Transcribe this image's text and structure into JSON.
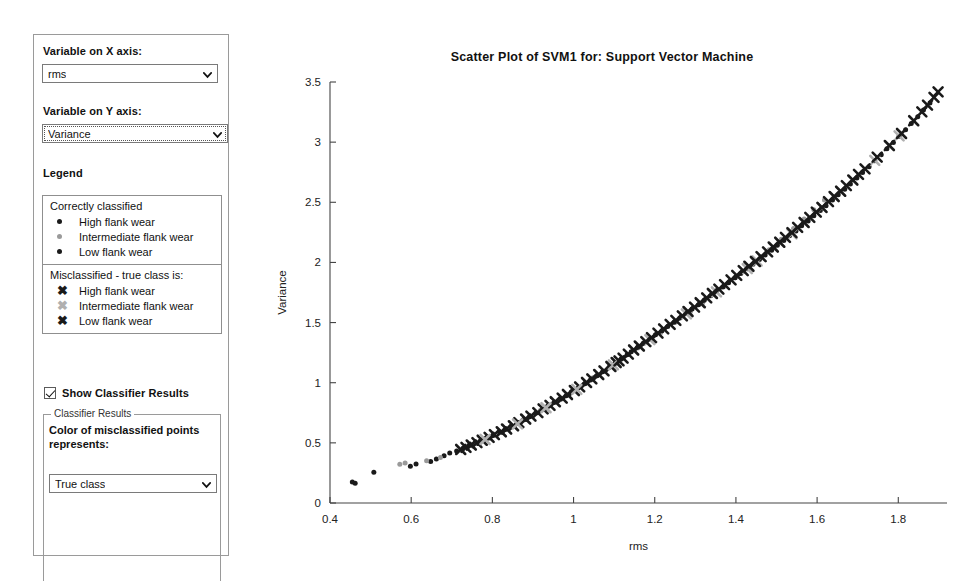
{
  "sidebar": {
    "x_axis_label": "Variable on X axis:",
    "x_axis_value": "rms",
    "y_axis_label": "Variable on Y axis:",
    "y_axis_value": "Variance",
    "legend_title": "Legend",
    "legend": {
      "correct_heading": "Correctly classified",
      "correct_items": [
        {
          "label": "High flank wear",
          "color": "#1a1a1a",
          "marker": "dot"
        },
        {
          "label": "Intermediate flank wear",
          "color": "#9a9a9a",
          "marker": "dot"
        },
        {
          "label": "Low flank wear",
          "color": "#1a1a1a",
          "marker": "dot"
        }
      ],
      "mis_heading": "Misclassified - true class is:",
      "mis_items": [
        {
          "label": "High flank wear",
          "color": "#1a1a1a",
          "marker": "x",
          "glyph": "✖"
        },
        {
          "label": "Intermediate flank wear",
          "color": "#b0b0b0",
          "marker": "x",
          "glyph": "✖"
        },
        {
          "label": "Low flank wear",
          "color": "#1a1a1a",
          "marker": "x",
          "glyph": "✖"
        }
      ]
    },
    "show_classifier_results_label": "Show Classifier Results",
    "show_classifier_results_checked": true,
    "classifier_fieldset_legend": "Classifier Results",
    "classifier_desc": "Color of misclassified points represents:",
    "classifier_value": "True class",
    "caret_icon": "chevron-down-icon"
  },
  "chart_data": {
    "type": "scatter",
    "title": "Scatter Plot of SVM1 for: Support Vector Machine",
    "xlabel": "rms",
    "ylabel": "Variance",
    "xlim": [
      0.4,
      1.92
    ],
    "ylim": [
      0,
      3.5
    ],
    "xticks": [
      0.4,
      0.6,
      0.8,
      1.0,
      1.2,
      1.4,
      1.6,
      1.8
    ],
    "xticklabels": [
      "0.4",
      "0.6",
      "0.8",
      "1",
      "1.2",
      "1.4",
      "1.6",
      "1.8"
    ],
    "yticks": [
      0,
      0.5,
      1.0,
      1.5,
      2.0,
      2.5,
      3.0,
      3.5
    ],
    "yticklabels": [
      "0",
      "0.5",
      "1",
      "1.5",
      "2",
      "2.5",
      "3",
      "3.5"
    ],
    "grid": false,
    "legend_position": "external-sidebar",
    "series": [
      {
        "name": "Correctly classified - High flank wear",
        "marker": "dot",
        "color": "#1a1a1a",
        "size": 5,
        "points": [
          [
            0.455,
            0.175
          ],
          [
            0.462,
            0.165
          ],
          [
            0.508,
            0.255
          ],
          [
            0.598,
            0.305
          ],
          [
            0.612,
            0.325
          ],
          [
            0.648,
            0.345
          ],
          [
            0.662,
            0.365
          ],
          [
            0.681,
            0.392
          ],
          [
            0.695,
            0.415
          ],
          [
            0.712,
            0.432
          ],
          [
            0.728,
            0.455
          ],
          [
            0.742,
            0.478
          ],
          [
            0.758,
            0.498
          ],
          [
            0.772,
            0.515
          ],
          [
            0.788,
            0.538
          ],
          [
            0.802,
            0.562
          ],
          [
            0.818,
            0.588
          ],
          [
            0.832,
            0.612
          ],
          [
            0.848,
            0.638
          ],
          [
            0.862,
            0.662
          ],
          [
            0.878,
            0.692
          ],
          [
            0.892,
            0.718
          ],
          [
            0.908,
            0.748
          ],
          [
            0.922,
            0.775
          ],
          [
            0.938,
            0.805
          ],
          [
            0.952,
            0.835
          ],
          [
            0.968,
            0.862
          ],
          [
            0.982,
            0.892
          ],
          [
            0.995,
            0.925
          ],
          [
            1.012,
            0.958
          ],
          [
            1.028,
            0.992
          ],
          [
            1.042,
            1.022
          ],
          [
            1.058,
            1.058
          ],
          [
            1.072,
            1.092
          ],
          [
            1.088,
            1.128
          ],
          [
            1.102,
            1.162
          ],
          [
            1.118,
            1.198
          ],
          [
            1.132,
            1.232
          ]
        ]
      },
      {
        "name": "Correctly classified - Intermediate flank wear",
        "marker": "dot",
        "color": "#9a9a9a",
        "size": 5,
        "points": [
          [
            0.572,
            0.322
          ],
          [
            0.585,
            0.332
          ],
          [
            0.638,
            0.352
          ],
          [
            0.672,
            0.378
          ],
          [
            0.758,
            0.492
          ],
          [
            0.848,
            0.632
          ],
          [
            0.918,
            0.768
          ],
          [
            0.962,
            0.848
          ],
          [
            1.048,
            1.042
          ],
          [
            1.158,
            1.288
          ],
          [
            1.192,
            1.368
          ],
          [
            1.215,
            1.418
          ],
          [
            1.252,
            1.505
          ],
          [
            1.288,
            1.592
          ],
          [
            1.318,
            1.665
          ],
          [
            1.345,
            1.735
          ],
          [
            1.372,
            1.802
          ],
          [
            1.398,
            1.872
          ],
          [
            1.418,
            1.925
          ],
          [
            1.448,
            2.005
          ],
          [
            1.462,
            2.048
          ],
          [
            1.482,
            2.105
          ],
          [
            1.512,
            2.192
          ],
          [
            1.542,
            2.282
          ],
          [
            1.568,
            2.362
          ],
          [
            1.592,
            2.438
          ],
          [
            1.618,
            2.518
          ]
        ]
      },
      {
        "name": "Correctly classified - Low flank wear",
        "marker": "dot",
        "color": "#1a1a1a",
        "size": 5,
        "points": [
          [
            1.142,
            1.258
          ],
          [
            1.158,
            1.295
          ],
          [
            1.172,
            1.328
          ],
          [
            1.188,
            1.362
          ],
          [
            1.202,
            1.398
          ],
          [
            1.218,
            1.432
          ],
          [
            1.232,
            1.468
          ],
          [
            1.248,
            1.502
          ],
          [
            1.262,
            1.538
          ],
          [
            1.278,
            1.575
          ],
          [
            1.292,
            1.612
          ],
          [
            1.308,
            1.648
          ],
          [
            1.322,
            1.685
          ],
          [
            1.338,
            1.722
          ],
          [
            1.352,
            1.758
          ],
          [
            1.368,
            1.795
          ],
          [
            1.382,
            1.832
          ],
          [
            1.398,
            1.872
          ],
          [
            1.412,
            1.908
          ],
          [
            1.428,
            1.948
          ],
          [
            1.442,
            1.985
          ],
          [
            1.458,
            2.025
          ],
          [
            1.472,
            2.062
          ],
          [
            1.488,
            2.102
          ],
          [
            1.502,
            2.142
          ],
          [
            1.518,
            2.182
          ],
          [
            1.532,
            2.222
          ],
          [
            1.548,
            2.262
          ],
          [
            1.562,
            2.305
          ],
          [
            1.578,
            2.345
          ],
          [
            1.592,
            2.388
          ],
          [
            1.608,
            2.432
          ],
          [
            1.622,
            2.472
          ],
          [
            1.638,
            2.518
          ],
          [
            1.652,
            2.562
          ],
          [
            1.668,
            2.608
          ],
          [
            1.682,
            2.652
          ],
          [
            1.698,
            2.702
          ],
          [
            1.712,
            2.748
          ],
          [
            1.728,
            2.795
          ],
          [
            1.742,
            2.845
          ],
          [
            1.758,
            2.895
          ],
          [
            1.772,
            2.945
          ],
          [
            1.788,
            2.998
          ],
          [
            1.802,
            3.048
          ],
          [
            1.818,
            3.102
          ],
          [
            1.832,
            3.155
          ],
          [
            1.848,
            3.212
          ],
          [
            1.862,
            3.268
          ],
          [
            1.878,
            3.325
          ]
        ]
      },
      {
        "name": "Misclassified - High flank wear",
        "marker": "x",
        "color": "#1a1a1a",
        "size": 9,
        "points": [
          [
            0.722,
            0.445
          ],
          [
            0.735,
            0.462
          ],
          [
            0.748,
            0.482
          ],
          [
            0.762,
            0.502
          ],
          [
            0.775,
            0.522
          ],
          [
            0.792,
            0.545
          ],
          [
            0.805,
            0.568
          ],
          [
            0.822,
            0.592
          ],
          [
            0.835,
            0.615
          ],
          [
            0.852,
            0.642
          ],
          [
            0.865,
            0.668
          ],
          [
            0.882,
            0.698
          ],
          [
            0.895,
            0.722
          ],
          [
            0.912,
            0.752
          ],
          [
            0.925,
            0.782
          ],
          [
            0.942,
            0.812
          ],
          [
            0.955,
            0.842
          ],
          [
            0.972,
            0.872
          ],
          [
            0.985,
            0.902
          ],
          [
            1.002,
            0.935
          ],
          [
            1.015,
            0.965
          ],
          [
            1.032,
            1.002
          ],
          [
            1.045,
            1.032
          ],
          [
            1.062,
            1.068
          ],
          [
            1.075,
            1.098
          ],
          [
            1.092,
            1.135
          ],
          [
            1.105,
            1.168
          ]
        ]
      },
      {
        "name": "Misclassified - Intermediate flank wear",
        "marker": "x",
        "color": "#b0b0b0",
        "size": 9,
        "points": [
          [
            0.782,
            0.528
          ],
          [
            0.862,
            0.658
          ],
          [
            0.932,
            0.792
          ],
          [
            1.008,
            0.945
          ],
          [
            1.098,
            1.148
          ],
          [
            1.188,
            1.358
          ],
          [
            1.278,
            1.572
          ],
          [
            1.352,
            1.755
          ],
          [
            1.428,
            1.948
          ],
          [
            1.452,
            2.012
          ],
          [
            1.538,
            2.238
          ],
          [
            1.612,
            2.455
          ],
          [
            1.742,
            2.848
          ],
          [
            1.802,
            3.052
          ]
        ]
      },
      {
        "name": "Misclassified - Low flank wear",
        "marker": "x",
        "color": "#1a1a1a",
        "size": 9,
        "points": [
          [
            1.112,
            1.182
          ],
          [
            1.122,
            1.205
          ],
          [
            1.135,
            1.238
          ],
          [
            1.148,
            1.272
          ],
          [
            1.162,
            1.305
          ],
          [
            1.178,
            1.342
          ],
          [
            1.192,
            1.375
          ],
          [
            1.208,
            1.412
          ],
          [
            1.222,
            1.448
          ],
          [
            1.238,
            1.485
          ],
          [
            1.252,
            1.518
          ],
          [
            1.268,
            1.555
          ],
          [
            1.282,
            1.592
          ],
          [
            1.298,
            1.628
          ],
          [
            1.312,
            1.665
          ],
          [
            1.328,
            1.705
          ],
          [
            1.342,
            1.742
          ],
          [
            1.358,
            1.778
          ],
          [
            1.372,
            1.815
          ],
          [
            1.388,
            1.855
          ],
          [
            1.402,
            1.892
          ],
          [
            1.418,
            1.932
          ],
          [
            1.432,
            1.968
          ],
          [
            1.448,
            2.008
          ],
          [
            1.462,
            2.048
          ],
          [
            1.478,
            2.088
          ],
          [
            1.492,
            2.128
          ],
          [
            1.508,
            2.168
          ],
          [
            1.522,
            2.208
          ],
          [
            1.538,
            2.248
          ],
          [
            1.552,
            2.292
          ],
          [
            1.568,
            2.332
          ],
          [
            1.582,
            2.375
          ],
          [
            1.598,
            2.418
          ],
          [
            1.612,
            2.458
          ],
          [
            1.628,
            2.505
          ],
          [
            1.642,
            2.548
          ],
          [
            1.658,
            2.592
          ],
          [
            1.672,
            2.638
          ],
          [
            1.688,
            2.685
          ],
          [
            1.702,
            2.732
          ],
          [
            1.718,
            2.778
          ],
          [
            1.748,
            2.875
          ],
          [
            1.778,
            2.972
          ],
          [
            1.808,
            3.072
          ],
          [
            1.838,
            3.178
          ],
          [
            1.858,
            3.252
          ],
          [
            1.872,
            3.308
          ],
          [
            1.888,
            3.372
          ],
          [
            1.898,
            3.418
          ]
        ]
      }
    ]
  }
}
